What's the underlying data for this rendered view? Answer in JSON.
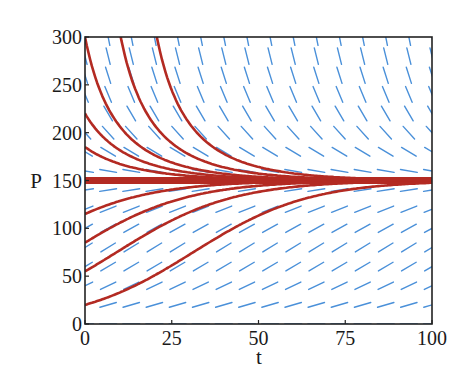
{
  "chart_data": {
    "type": "line",
    "title": "",
    "subtitle": "Slope (direction) field with solution curves of a logistic-type equation, equilibrium at P = 150",
    "xlabel": "t",
    "ylabel": "P",
    "xlim": [
      0,
      100
    ],
    "ylim": [
      0,
      300
    ],
    "x_ticks": [
      0,
      25,
      50,
      75,
      100
    ],
    "y_ticks": [
      0,
      50,
      100,
      150,
      200,
      250,
      300
    ],
    "x_tick_labels": [
      "0",
      "25",
      "50",
      "75",
      "100"
    ],
    "y_tick_labels": [
      "0",
      "50",
      "100",
      "150",
      "200",
      "250",
      "300"
    ],
    "grid": false,
    "legend": null,
    "model": {
      "equation": "dP/dt = r P (1 - P/K)",
      "r": 0.06,
      "K": 150
    },
    "slope_field": {
      "t_step": 6.6667,
      "P_step": 20,
      "segment_length_px": 17,
      "color": "#4a90d9"
    },
    "curve_color": "#b32a22",
    "equilibrium": {
      "P": 150,
      "line_width": 7
    },
    "x": [
      0,
      10,
      20,
      30,
      40,
      50,
      60,
      70,
      80,
      90,
      100
    ],
    "series": [
      {
        "name": "P0=20",
        "P0": 20,
        "t0": 0,
        "values": [
          20,
          32.8,
          50.4,
          72.8,
          94.7,
          113.3,
          126.0,
          136.7,
          142.4,
          145.7,
          147.6
        ]
      },
      {
        "name": "P0=55",
        "P0": 55,
        "t0": 0,
        "values": [
          55,
          77.1,
          99.0,
          116.4,
          129.7,
          138.3,
          143.3,
          146.2,
          147.9,
          148.8,
          149.4
        ]
      },
      {
        "name": "P0=85",
        "P0": 85,
        "t0": 0,
        "values": [
          85,
          105.5,
          122.0,
          133.2,
          140.3,
          144.5,
          146.9,
          148.3,
          149.1,
          149.5,
          149.7
        ]
      },
      {
        "name": "P0=115",
        "P0": 115,
        "t0": 0,
        "values": [
          115,
          129.5,
          137.5,
          142.9,
          146.0,
          147.8,
          148.8,
          149.3,
          149.6,
          149.8,
          149.9
        ]
      },
      {
        "name": "P0=150 (equilibrium)",
        "P0": 150,
        "t0": 0,
        "values": [
          150,
          150,
          150,
          150,
          150,
          150,
          150,
          150,
          150,
          150,
          150
        ]
      },
      {
        "name": "P0=185",
        "P0": 185,
        "t0": 0,
        "values": [
          185,
          167.4,
          159.0,
          154.8,
          152.6,
          151.4,
          150.8,
          150.4,
          150.2,
          150.1,
          150.1
        ]
      },
      {
        "name": "P0=220",
        "P0": 220,
        "t0": 0,
        "values": [
          220,
          182.4,
          165.9,
          158.3,
          154.2,
          152.4,
          151.3,
          150.7,
          150.4,
          150.2,
          150.1
        ]
      },
      {
        "name": "P0=300",
        "P0": 300,
        "t0": 0,
        "values": [
          300,
          206.2,
          176.6,
          163.4,
          157.0,
          153.8,
          152.1,
          151.1,
          150.6,
          150.3,
          150.2
        ]
      },
      {
        "name": "P=300 at t=10.3",
        "P0": 300,
        "t0": 10.3,
        "values": [
          null,
          null,
          208.2,
          177.2,
          163.8,
          157.3,
          153.9,
          152.1,
          151.1,
          150.6,
          150.3
        ]
      },
      {
        "name": "P=300 at t=20.7",
        "P0": 300,
        "t0": 20.7,
        "values": [
          null,
          null,
          null,
          210.1,
          177.9,
          164.1,
          157.4,
          154.0,
          152.2,
          151.2,
          150.6
        ]
      }
    ]
  }
}
